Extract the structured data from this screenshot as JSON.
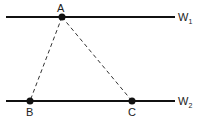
{
  "diagram": {
    "lines": [
      {
        "id": "W1",
        "label": "W",
        "subscript": "1",
        "y": 17,
        "x1": 6,
        "x2": 175
      },
      {
        "id": "W2",
        "label": "W",
        "subscript": "2",
        "y": 101,
        "x1": 6,
        "x2": 175
      }
    ],
    "points": [
      {
        "id": "A",
        "label": "A",
        "x": 62,
        "y": 17
      },
      {
        "id": "B",
        "label": "B",
        "x": 30,
        "y": 101
      },
      {
        "id": "C",
        "label": "C",
        "x": 132,
        "y": 101
      }
    ],
    "dashed_segments": [
      [
        "A",
        "B"
      ],
      [
        "A",
        "C"
      ]
    ],
    "colors": {
      "stroke": "#111111",
      "text": "#222222"
    }
  }
}
